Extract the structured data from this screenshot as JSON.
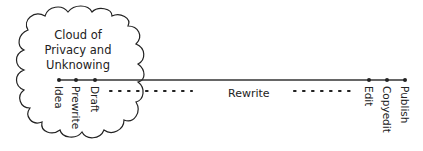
{
  "cloud": {
    "lines": [
      "Cloud of",
      "Privacy and",
      "Unknowing"
    ]
  },
  "timeline": {
    "stages": [
      {
        "label": "Idea",
        "x": 59
      },
      {
        "label": "Prewrite",
        "x": 76
      },
      {
        "label": "Draft",
        "x": 95
      },
      {
        "label": "Edit",
        "x": 369
      },
      {
        "label": "Copyedit",
        "x": 387
      },
      {
        "label": "Publish",
        "x": 405
      }
    ],
    "rewrite_label": "Rewrite"
  },
  "colors": {
    "ink": "#222222",
    "background": "#ffffff"
  }
}
